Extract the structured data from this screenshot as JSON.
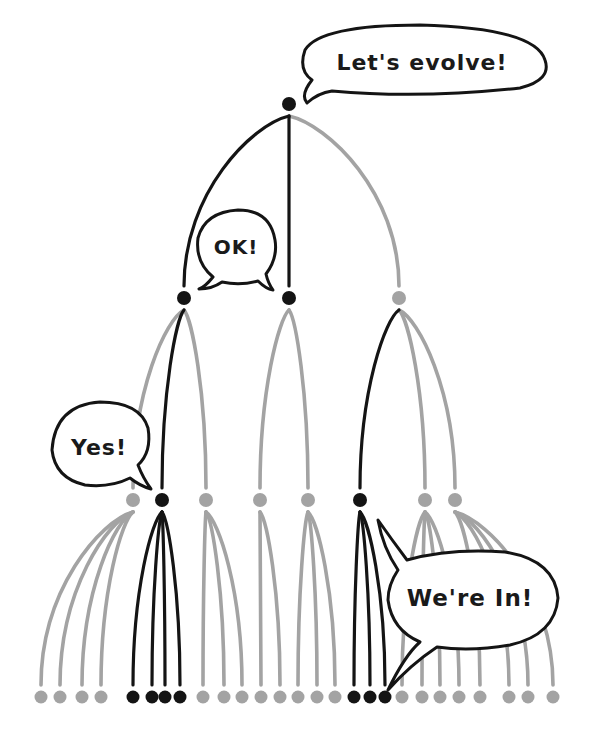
{
  "diagram": {
    "type": "evolution-tree",
    "colors": {
      "selected": "#141414",
      "unselected": "#a3a3a3",
      "bubble_stroke": "#141414",
      "bubble_fill": "#ffffff"
    },
    "speech_bubbles": [
      {
        "id": "root",
        "text": "Let's evolve!"
      },
      {
        "id": "level1",
        "text": "OK!"
      },
      {
        "id": "level2",
        "text": "Yes!"
      },
      {
        "id": "level3",
        "text": "We're In!"
      }
    ],
    "levels": [
      {
        "name": "root",
        "nodes": [
          {
            "id": "r",
            "selected": true
          }
        ]
      },
      {
        "name": "generation-1",
        "nodes": [
          {
            "id": "a",
            "parent": "r",
            "selected": true
          },
          {
            "id": "b",
            "parent": "r",
            "selected": true
          },
          {
            "id": "c",
            "parent": "r",
            "selected": false
          }
        ]
      },
      {
        "name": "generation-2",
        "nodes": [
          {
            "id": "a1",
            "parent": "a",
            "selected": false
          },
          {
            "id": "a2",
            "parent": "a",
            "selected": true
          },
          {
            "id": "a3",
            "parent": "a",
            "selected": false
          },
          {
            "id": "b1",
            "parent": "b",
            "selected": false
          },
          {
            "id": "b2",
            "parent": "b",
            "selected": false
          },
          {
            "id": "c1",
            "parent": "c",
            "selected": true
          },
          {
            "id": "c2",
            "parent": "c",
            "selected": false
          },
          {
            "id": "c3",
            "parent": "c",
            "selected": false
          }
        ]
      },
      {
        "name": "generation-3",
        "nodes": [
          {
            "id": "a1-1",
            "parent": "a1",
            "selected": false
          },
          {
            "id": "a1-2",
            "parent": "a1",
            "selected": false
          },
          {
            "id": "a1-3",
            "parent": "a1",
            "selected": false
          },
          {
            "id": "a1-4",
            "parent": "a1",
            "selected": false
          },
          {
            "id": "a2-1",
            "parent": "a2",
            "selected": true
          },
          {
            "id": "a2-2",
            "parent": "a2",
            "selected": true
          },
          {
            "id": "a2-3",
            "parent": "a2",
            "selected": true
          },
          {
            "id": "a2-4",
            "parent": "a2",
            "selected": true
          },
          {
            "id": "a3-1",
            "parent": "a3",
            "selected": false
          },
          {
            "id": "a3-2",
            "parent": "a3",
            "selected": false
          },
          {
            "id": "a3-3",
            "parent": "a3",
            "selected": false
          },
          {
            "id": "b1-1",
            "parent": "b1",
            "selected": false
          },
          {
            "id": "b1-2",
            "parent": "b1",
            "selected": false
          },
          {
            "id": "b2-1",
            "parent": "b2",
            "selected": false
          },
          {
            "id": "b2-2",
            "parent": "b2",
            "selected": false
          },
          {
            "id": "b2-3",
            "parent": "b2",
            "selected": false
          },
          {
            "id": "c1-1",
            "parent": "c1",
            "selected": true
          },
          {
            "id": "c1-2",
            "parent": "c1",
            "selected": true
          },
          {
            "id": "c1-3",
            "parent": "c1",
            "selected": true
          },
          {
            "id": "c2-1",
            "parent": "c2",
            "selected": false
          },
          {
            "id": "c2-2",
            "parent": "c2",
            "selected": false
          },
          {
            "id": "c2-3",
            "parent": "c2",
            "selected": false
          },
          {
            "id": "c2-4",
            "parent": "c2",
            "selected": false
          },
          {
            "id": "c3-1",
            "parent": "c3",
            "selected": false
          },
          {
            "id": "c3-2",
            "parent": "c3",
            "selected": false
          },
          {
            "id": "c3-3",
            "parent": "c3",
            "selected": false
          },
          {
            "id": "c3-4",
            "parent": "c3",
            "selected": false
          }
        ]
      }
    ]
  }
}
